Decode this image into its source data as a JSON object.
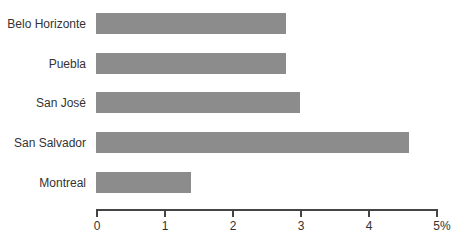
{
  "chart_data": {
    "type": "bar",
    "orientation": "horizontal",
    "title": "",
    "xlabel": "",
    "ylabel": "",
    "categories": [
      "Belo Horizonte",
      "Puebla",
      "San José",
      "San Salvador",
      "Montreal"
    ],
    "values": [
      2.8,
      2.8,
      3.0,
      4.6,
      1.4
    ],
    "unit": "%",
    "xlim": [
      0,
      5
    ],
    "xticks": [
      0,
      1,
      2,
      3,
      4,
      5
    ],
    "xtick_labels": [
      "0",
      "1",
      "2",
      "3",
      "4",
      "5%"
    ],
    "grid": false,
    "legend": null,
    "bar_color": "#8c8c8c"
  }
}
